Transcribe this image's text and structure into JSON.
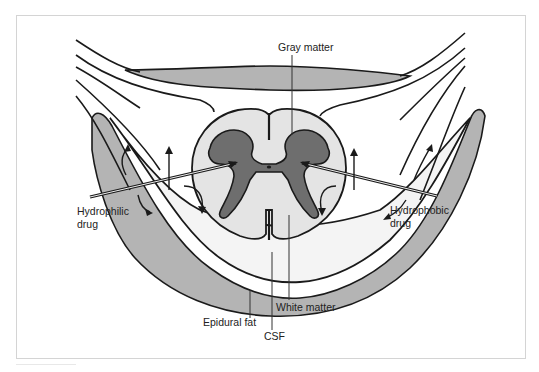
{
  "figure": {
    "labels": {
      "gray_matter": "Gray matter",
      "hydrophilic_line1": "Hydrophilic",
      "hydrophilic_line2": "drug",
      "hydrophobic_line1": "Hydrophobic",
      "hydrophobic_line2": "drug",
      "epidural_fat": "Epidural fat",
      "csf": "CSF",
      "white_matter": "White matter"
    },
    "colors": {
      "outline": "#1a1a1a",
      "fat_fill": "#b4b4b4",
      "gray_matter_fill": "#6e6e6e",
      "white_matter_fill": "#e4e4e4",
      "csf_fill": "#f2f2f2",
      "frame_border": "#d4d4d4",
      "background": "#ffffff"
    }
  }
}
